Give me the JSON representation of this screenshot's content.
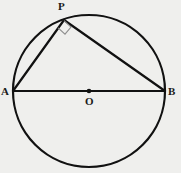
{
  "figure": {
    "canvas": {
      "width": 181,
      "height": 173
    },
    "background_color": "#efefed",
    "stroke_color": "#111111",
    "marker_color": "#8d8d8d",
    "circle": {
      "name": "circle-O",
      "center_x": 89,
      "center_y": 91,
      "radius": 76,
      "stroke_width": 2.2
    },
    "points": [
      {
        "id": "A",
        "label": "A",
        "x": 13,
        "y": 91,
        "on": "circle"
      },
      {
        "id": "B",
        "label": "B",
        "x": 165,
        "y": 91,
        "on": "circle"
      },
      {
        "id": "O",
        "label": "O",
        "x": 89,
        "y": 91,
        "on": "center"
      },
      {
        "id": "P",
        "label": "P",
        "x": 64,
        "y": 20,
        "on": "circle"
      }
    ],
    "segments": [
      {
        "name": "diameter-AB",
        "from": "A",
        "to": "B",
        "x1": 13,
        "y1": 91,
        "x2": 165,
        "y2": 91,
        "stroke_width": 2.2
      },
      {
        "name": "chord-AP",
        "from": "A",
        "to": "P",
        "x1": 13,
        "y1": 91,
        "x2": 64,
        "y2": 20,
        "stroke_width": 2.2
      },
      {
        "name": "chord-PB",
        "from": "P",
        "to": "B",
        "x1": 64,
        "y1": 20,
        "x2": 165,
        "y2": 91,
        "stroke_width": 2.2
      }
    ],
    "center_dot": {
      "name": "center-point-O",
      "x": 89,
      "y": 91,
      "radius": 2.3
    },
    "right_angle_marker": {
      "name": "right-angle-marker-P",
      "at_point": "P",
      "angle_degrees": 90,
      "path": "M 58.1,27.8 L 65.0,34.2 L 71.0,27.0 L 64.0,20.6",
      "stroke_width": 1.1
    }
  }
}
